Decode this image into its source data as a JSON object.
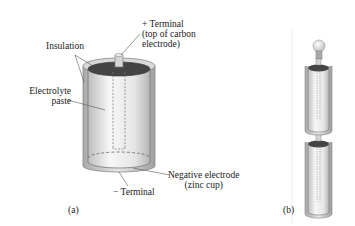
{
  "figure_a": {
    "caption": "(a)",
    "labels": {
      "positive_terminal_line1": "+ Terminal",
      "positive_terminal_line2": "(top of carbon",
      "positive_terminal_line3": "electrode)",
      "insulation": "Insulation",
      "electrolyte_line1": "Electrolyte",
      "electrolyte_line2": "paste",
      "negative_electrode_line1": "Negative electrode",
      "negative_electrode_line2": "(zinc cup)",
      "negative_terminal": "− Terminal"
    }
  },
  "figure_b": {
    "caption": "(b)"
  },
  "colors": {
    "body_fill": "#eeeeee",
    "body_edge": "#777777",
    "top_dark": "#444444",
    "outer_case": "#cccccc",
    "line": "#555555"
  }
}
